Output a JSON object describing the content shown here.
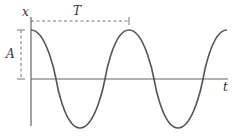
{
  "diagram": {
    "type": "cosine-wave-oscillation",
    "labels": {
      "y_axis": "x",
      "x_axis": "t",
      "period": "T",
      "amplitude": "A"
    },
    "curve": {
      "function": "x = A cos(2πt/T)",
      "cycles_shown": 2
    },
    "colors": {
      "curve": "#555555",
      "axes": "#666666",
      "dashed": "#777777",
      "text": "#333333"
    }
  }
}
